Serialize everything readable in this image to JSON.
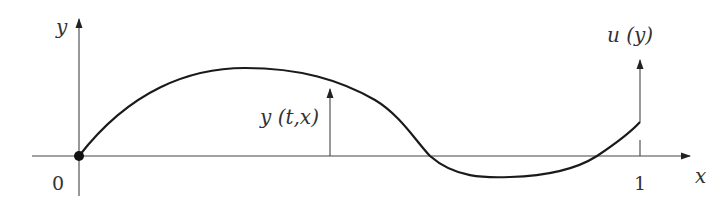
{
  "diagram": {
    "labels": {
      "y_axis": "y",
      "x_axis": "x",
      "origin": "0",
      "x_end": "1",
      "displacement": "y (t,x)",
      "control": "u (y)"
    },
    "colors": {
      "curve": "#1a1a1a",
      "axis": "#444444",
      "text": "#333333"
    }
  }
}
